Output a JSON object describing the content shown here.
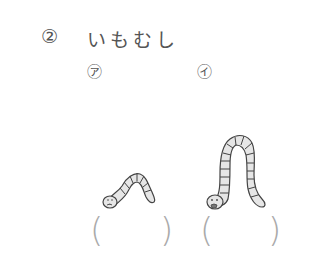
{
  "question": {
    "number": "②",
    "title": "いもむし"
  },
  "options": [
    {
      "label": "㋐",
      "answer_open": "(",
      "answer_close": ")"
    },
    {
      "label": "㋑",
      "answer_open": "(",
      "answer_close": ")"
    }
  ],
  "colors": {
    "text": "#555555",
    "paren": "#aaaaaa",
    "worm_fill": "#e6e6e6",
    "worm_stroke": "#444444"
  }
}
